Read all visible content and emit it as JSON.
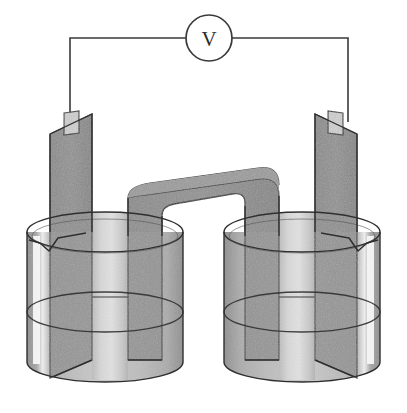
{
  "figure": {
    "background_color": "#ffffff",
    "width": 407,
    "height": 413
  },
  "meter": {
    "name": "voltmeter",
    "label": "V",
    "shape": "circle",
    "center_x": 209,
    "center_y": 38,
    "radius": 23,
    "stroke_color": "#3a3a3a",
    "fill_color": "#ffffff"
  },
  "wires": [
    {
      "name": "left-wire",
      "from": "voltmeter-left-terminal",
      "to": "left-electrode-tab",
      "color": "#3a3a3a",
      "path": "M 186 38 L 70 38 L 70 120"
    },
    {
      "name": "right-wire",
      "from": "voltmeter-right-terminal",
      "to": "right-electrode-tab",
      "color": "#3a3a3a",
      "path": "M 232 38 L 348 38 L 348 120"
    }
  ],
  "electrodes": [
    {
      "name": "left-electrode",
      "side": "left",
      "fill_color": "#8d8d8d",
      "stroke_color": "#2f2f2f",
      "tab_color": "#c9c9c9",
      "label": ""
    },
    {
      "name": "right-electrode",
      "side": "right",
      "fill_color": "#8d8d8d",
      "stroke_color": "#2f2f2f",
      "tab_color": "#c9c9c9",
      "label": ""
    }
  ],
  "salt_bridge": {
    "name": "salt-bridge",
    "shape": "inverted-u-tube",
    "fill_color": "#8d8d8d",
    "stroke_color": "#2f2f2f",
    "label": ""
  },
  "beakers": [
    {
      "name": "left-beaker",
      "side": "left",
      "spout_side": "left",
      "glass_color": "#a8a8a8",
      "solution_color": "#b9b9b9",
      "highlight_color": "#f2f2f2",
      "stroke_color": "#2f2f2f",
      "solution_label": ""
    },
    {
      "name": "right-beaker",
      "side": "right",
      "spout_side": "right",
      "glass_color": "#a8a8a8",
      "solution_color": "#b9b9b9",
      "highlight_color": "#f2f2f2",
      "stroke_color": "#2f2f2f",
      "solution_label": ""
    }
  ],
  "colors": {
    "line": "#2f2f2f",
    "wire": "#3a3a3a",
    "metal": "#8d8d8d",
    "metal_dark": "#7b7b7b",
    "glass": "#a8a8a8",
    "solution": "#bdbdbd",
    "solution_light": "#d7d7d7",
    "highlight": "#f4f4f4",
    "background": "#ffffff"
  }
}
